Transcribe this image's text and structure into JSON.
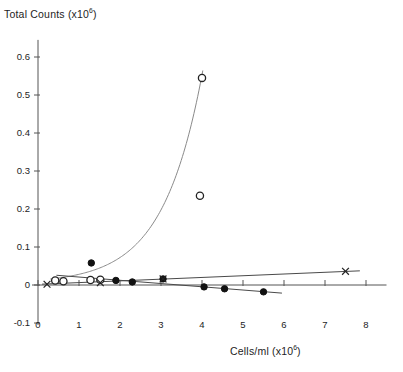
{
  "chart_data": {
    "type": "scatter",
    "title": "",
    "ylabel": "Total Counts (x10",
    "ylabel_sup": "6",
    "ylabel_tail": ")",
    "xlabel": "Cells/ml (x10",
    "xlabel_sup": "6",
    "xlabel_tail": ")",
    "xlim": [
      -0.35,
      8.6
    ],
    "ylim": [
      -0.1,
      0.65
    ],
    "grid": false,
    "legend": "none",
    "xticks": [
      0,
      1,
      2,
      3,
      4,
      5,
      6,
      7,
      8
    ],
    "xtick_labels": [
      "0",
      "1",
      "2",
      "3",
      "4",
      "5",
      "6",
      "7",
      "8"
    ],
    "yticks": [
      -0.1,
      0,
      0.1,
      0.2,
      0.3,
      0.4,
      0.5,
      0.6
    ],
    "ytick_labels": [
      "-0.1",
      "0",
      "0.1",
      "0.2",
      "0.3",
      "0.4",
      "0.5",
      "0.6"
    ],
    "series": [
      {
        "name": "open-circle-series",
        "marker": "open-circle",
        "color": "#222222",
        "has_fit_curve": true,
        "fit_type": "exponential",
        "points": [
          {
            "x": 0.42,
            "y": 0.012
          },
          {
            "x": 0.62,
            "y": 0.01
          },
          {
            "x": 1.28,
            "y": 0.013
          },
          {
            "x": 1.52,
            "y": 0.014
          },
          {
            "x": 3.95,
            "y": 0.235
          },
          {
            "x": 4.0,
            "y": 0.545
          }
        ]
      },
      {
        "name": "filled-circle-series",
        "marker": "filled-circle",
        "color": "#111111",
        "has_fit_curve": true,
        "fit_type": "linear-decreasing",
        "points": [
          {
            "x": 1.3,
            "y": 0.058
          },
          {
            "x": 1.9,
            "y": 0.012
          },
          {
            "x": 2.3,
            "y": 0.008
          },
          {
            "x": 3.05,
            "y": 0.016
          },
          {
            "x": 4.05,
            "y": -0.005
          },
          {
            "x": 4.55,
            "y": -0.01
          },
          {
            "x": 5.5,
            "y": -0.018
          }
        ]
      },
      {
        "name": "x-marker-series",
        "marker": "x-cross",
        "color": "#222222",
        "has_fit_curve": true,
        "fit_type": "linear-increasing",
        "points": [
          {
            "x": 0.22,
            "y": 0.002
          },
          {
            "x": 1.52,
            "y": 0.006
          },
          {
            "x": 3.05,
            "y": 0.016
          },
          {
            "x": 7.5,
            "y": 0.036
          }
        ]
      }
    ]
  }
}
